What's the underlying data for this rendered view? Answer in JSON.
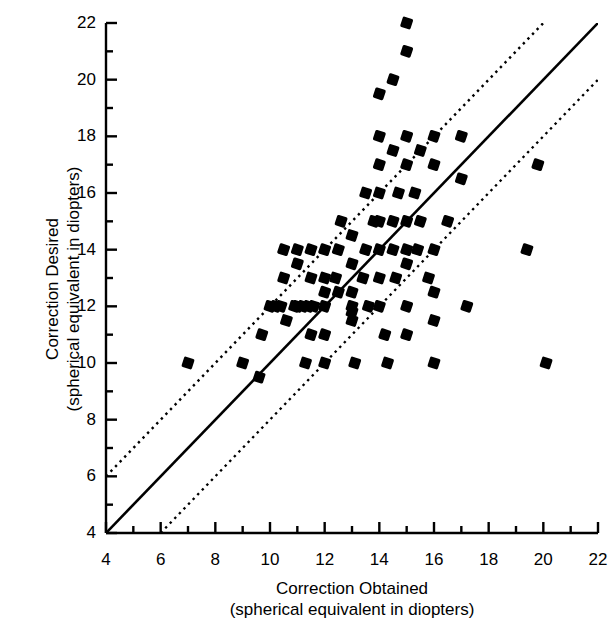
{
  "chart_data": {
    "type": "scatter",
    "title": "",
    "xlabel": "Correction Obtained",
    "xlabel_line2": "(spherical equivalent in diopters)",
    "ylabel": "Correction Desired",
    "ylabel_line2": "(spherical equivalent in diopters)",
    "xlim": [
      4,
      22
    ],
    "ylim": [
      4,
      22
    ],
    "xticks": [
      4,
      6,
      8,
      10,
      12,
      14,
      16,
      18,
      20,
      22
    ],
    "yticks": [
      4,
      6,
      8,
      10,
      12,
      14,
      16,
      18,
      20,
      22
    ],
    "xtick_labels": [
      "4",
      "6",
      "8",
      "10",
      "12",
      "14",
      "16",
      "18",
      "20",
      "22"
    ],
    "ytick_labels": [
      "4",
      "6",
      "8",
      "10",
      "12",
      "14",
      "16",
      "18",
      "20",
      "22"
    ],
    "minor_tick_step": 1,
    "grid": false,
    "legend": "none",
    "marker": "filled-square",
    "marker_color": "#000000",
    "marker_size_px": 10,
    "reference_lines": [
      {
        "name": "identity",
        "style": "solid",
        "slope": 1,
        "intercept": 0,
        "color": "#000000",
        "label": "y = x"
      },
      {
        "name": "upper-bound",
        "style": "dotted",
        "slope": 1,
        "intercept": 2,
        "color": "#000000",
        "label": "y = x + 2"
      },
      {
        "name": "lower-bound",
        "style": "dotted",
        "slope": 1,
        "intercept": -2,
        "color": "#000000",
        "label": "y = x - 2"
      }
    ],
    "points": [
      [
        7.0,
        10.0
      ],
      [
        9.0,
        10.0
      ],
      [
        9.6,
        9.5
      ],
      [
        9.7,
        11.0
      ],
      [
        10.0,
        12.0
      ],
      [
        10.2,
        12.0
      ],
      [
        10.4,
        12.0
      ],
      [
        10.5,
        13.0
      ],
      [
        10.5,
        14.0
      ],
      [
        10.6,
        11.5
      ],
      [
        10.9,
        12.0
      ],
      [
        11.0,
        13.5
      ],
      [
        11.0,
        14.0
      ],
      [
        11.0,
        12.0
      ],
      [
        11.2,
        12.0
      ],
      [
        11.3,
        10.0
      ],
      [
        11.4,
        12.0
      ],
      [
        11.5,
        14.0
      ],
      [
        11.5,
        13.0
      ],
      [
        11.5,
        11.0
      ],
      [
        11.6,
        12.0
      ],
      [
        12.0,
        14.0
      ],
      [
        12.0,
        13.0
      ],
      [
        12.0,
        12.5
      ],
      [
        12.0,
        12.0
      ],
      [
        12.0,
        11.0
      ],
      [
        12.0,
        10.0
      ],
      [
        12.4,
        13.0
      ],
      [
        12.5,
        14.0
      ],
      [
        12.5,
        12.5
      ],
      [
        12.6,
        15.0
      ],
      [
        13.0,
        14.5
      ],
      [
        13.0,
        13.5
      ],
      [
        13.0,
        12.5
      ],
      [
        13.0,
        12.0
      ],
      [
        13.0,
        11.8
      ],
      [
        13.0,
        11.5
      ],
      [
        13.1,
        10.0
      ],
      [
        13.4,
        13.0
      ],
      [
        13.5,
        16.0
      ],
      [
        13.5,
        14.0
      ],
      [
        13.6,
        12.0
      ],
      [
        13.8,
        15.0
      ],
      [
        14.0,
        18.0
      ],
      [
        14.0,
        17.0
      ],
      [
        14.0,
        19.5
      ],
      [
        14.0,
        16.0
      ],
      [
        14.0,
        15.0
      ],
      [
        14.0,
        14.0
      ],
      [
        14.0,
        13.0
      ],
      [
        14.0,
        12.0
      ],
      [
        14.2,
        11.0
      ],
      [
        14.3,
        10.0
      ],
      [
        14.5,
        20.0
      ],
      [
        14.5,
        17.5
      ],
      [
        14.5,
        15.0
      ],
      [
        14.5,
        14.0
      ],
      [
        14.6,
        13.0
      ],
      [
        14.7,
        16.0
      ],
      [
        15.0,
        22.0
      ],
      [
        15.0,
        21.0
      ],
      [
        15.0,
        18.0
      ],
      [
        15.0,
        17.0
      ],
      [
        15.0,
        15.0
      ],
      [
        15.0,
        14.0
      ],
      [
        15.0,
        13.5
      ],
      [
        15.0,
        12.0
      ],
      [
        15.0,
        11.0
      ],
      [
        15.3,
        16.0
      ],
      [
        15.4,
        14.0
      ],
      [
        15.5,
        17.5
      ],
      [
        15.5,
        15.0
      ],
      [
        15.8,
        13.0
      ],
      [
        16.0,
        18.0
      ],
      [
        16.0,
        17.0
      ],
      [
        16.0,
        14.0
      ],
      [
        16.0,
        12.5
      ],
      [
        16.0,
        11.5
      ],
      [
        16.0,
        10.0
      ],
      [
        16.5,
        15.0
      ],
      [
        17.0,
        18.0
      ],
      [
        17.0,
        16.5
      ],
      [
        17.2,
        12.0
      ],
      [
        19.4,
        14.0
      ],
      [
        19.8,
        17.0
      ],
      [
        20.1,
        10.0
      ]
    ],
    "n_points": 86
  },
  "axes": {
    "x_title_line1": "Correction Obtained",
    "x_title_line2": "(spherical equivalent in diopters)",
    "y_title_line1": "Correction Desired",
    "y_title_line2": "(spherical equivalent in diopters)"
  }
}
